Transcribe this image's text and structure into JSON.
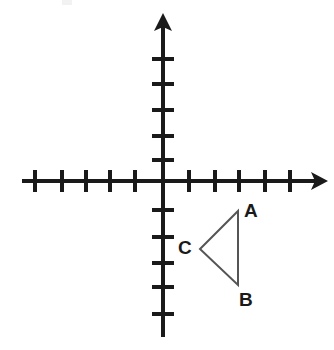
{
  "figure": {
    "background_color": "#ffffff",
    "ink_color": "#1a1a1a",
    "line_color": "#555555",
    "width": 334,
    "height": 350
  },
  "axes": {
    "origin": {
      "x": 163,
      "y": 181
    },
    "unit_px": 25,
    "stroke_width": 4,
    "tick_length": 22,
    "tick_width": 4,
    "x_axis": {
      "name": "x-axis",
      "start_x": 22,
      "end_x": 328,
      "y": 181,
      "arrow_at": "right",
      "ticks_left": [
        135,
        110,
        86,
        62,
        35
      ],
      "ticks_right": [
        189,
        215,
        239,
        265,
        290
      ]
    },
    "y_axis": {
      "name": "y-axis",
      "x": 163,
      "start_y": 13,
      "end_y": 337,
      "arrow_at": "top",
      "ticks_up": [
        160,
        136,
        110,
        84,
        59
      ],
      "ticks_down": [
        210,
        237,
        263,
        287,
        314
      ]
    }
  },
  "triangle": {
    "name": "triangle-ABC",
    "stroke_width": 2,
    "stroke_color": "#555555",
    "fill": "none",
    "vertices": [
      {
        "id": "A",
        "label": "A",
        "x": 238,
        "y": 211,
        "label_x": 244,
        "label_y": 201,
        "grid_x": 3,
        "grid_y": -1.2
      },
      {
        "id": "B",
        "label": "B",
        "x": 238,
        "y": 285,
        "label_x": 239,
        "label_y": 290,
        "grid_x": 3,
        "grid_y": -4.2
      },
      {
        "id": "C",
        "label": "C",
        "x": 200,
        "y": 249,
        "label_x": 178,
        "label_y": 238,
        "grid_x": 1.5,
        "grid_y": -2.7
      }
    ],
    "path": "M 238 211 L 238 285 L 200 249 Z"
  },
  "artifacts": [
    {
      "name": "scan-speck",
      "x": 62,
      "y": 0,
      "width": 10,
      "height": 5
    }
  ]
}
